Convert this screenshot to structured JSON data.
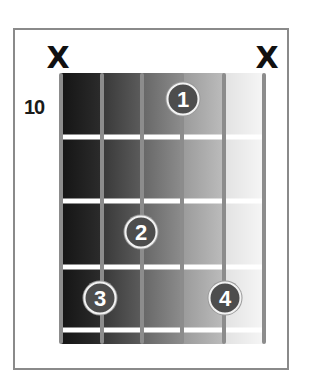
{
  "diagram": {
    "type": "guitar-chord-box",
    "starting_fret": "10",
    "string_markers": [
      {
        "string": 1,
        "symbol": "X",
        "meaning": "muted"
      },
      {
        "string": 6,
        "symbol": "X",
        "meaning": "muted"
      }
    ],
    "fingers": [
      {
        "label": "1",
        "string": 4,
        "fret": 1
      },
      {
        "label": "2",
        "string": 3,
        "fret": 2
      },
      {
        "label": "3",
        "string": 2,
        "fret": 3
      },
      {
        "label": "4",
        "string": 5,
        "fret": 3
      }
    ],
    "string_count": 6,
    "frets_shown": 4,
    "colors": {
      "frame": "#8a8a8a",
      "string": "#8c8c8c",
      "fret": "#ffffff",
      "dot_fill": "#4d4d4d",
      "dot_ring": "#f2f2f2"
    }
  }
}
